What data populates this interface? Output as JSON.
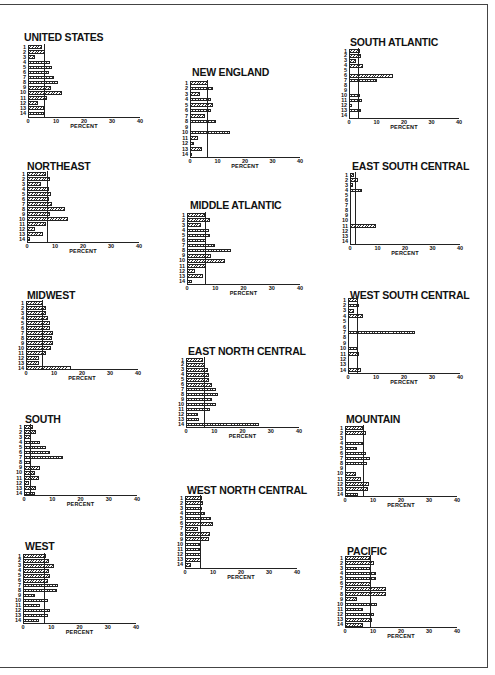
{
  "chart_data": [
    {
      "type": "bar",
      "orientation": "horizontal",
      "title": "UNITED STATES",
      "xlabel": "PERCENT",
      "xlim": [
        0,
        40
      ],
      "xticks": [
        0,
        10,
        20,
        30,
        40
      ],
      "categories": [
        "1",
        "2",
        "3",
        "4",
        "5",
        "6",
        "7",
        "8",
        "9",
        "10",
        "11",
        "12",
        "13",
        "14"
      ],
      "values": [
        5,
        6,
        2.4,
        8,
        8.6,
        7.5,
        9.3,
        10.7,
        8.2,
        12,
        6.7,
        3.6,
        5.7,
        5.7
      ],
      "reference_line": 5.7
    },
    {
      "type": "bar",
      "orientation": "horizontal",
      "title": "NEW ENGLAND",
      "xlabel": "PERCENT",
      "xlim": [
        0,
        40
      ],
      "xticks": [
        0,
        10,
        20,
        30,
        40
      ],
      "categories": [
        "1",
        "2",
        "3",
        "4",
        "5",
        "6",
        "7",
        "8",
        "9",
        "10",
        "11",
        "12",
        "13",
        "14"
      ],
      "values": [
        6.5,
        8.2,
        3.7,
        7.7,
        8.5,
        7.7,
        5.5,
        9.4,
        0,
        14.4,
        2.8,
        1.6,
        4.3,
        0.9
      ],
      "reference_line": 6.3
    },
    {
      "type": "bar",
      "orientation": "horizontal",
      "title": "SOUTH ATLANTIC",
      "xlabel": "PERCENT",
      "xlim": [
        0,
        40
      ],
      "xticks": [
        0,
        10,
        20,
        30,
        40
      ],
      "categories": [
        "1",
        "2",
        "3",
        "4",
        "5",
        "6",
        "7",
        "8",
        "9",
        "10",
        "11",
        "12",
        "13",
        "14"
      ],
      "values": [
        3.9,
        4.3,
        2.4,
        5.2,
        0,
        16,
        10,
        0,
        0,
        4,
        4.7,
        1.1,
        4.2,
        0
      ],
      "reference_line": 3.4
    },
    {
      "type": "bar",
      "orientation": "horizontal",
      "title": "NORTHEAST",
      "xlabel": "PERCENT",
      "xlim": [
        0,
        40
      ],
      "xticks": [
        0,
        10,
        20,
        30,
        40
      ],
      "categories": [
        "1",
        "2",
        "3",
        "4",
        "5",
        "6",
        "7",
        "8",
        "9",
        "10",
        "11",
        "12",
        "13",
        "14"
      ],
      "values": [
        6.7,
        8.2,
        4.9,
        7.9,
        8.5,
        7.9,
        8.9,
        13.4,
        8.2,
        14.6,
        6.7,
        3,
        5.7,
        1.2
      ],
      "reference_line": 7
    },
    {
      "type": "bar",
      "orientation": "horizontal",
      "title": "MIDDLE ATLANTIC",
      "xlabel": "PERCENT",
      "xlim": [
        0,
        40
      ],
      "xticks": [
        0,
        10,
        20,
        30,
        40
      ],
      "categories": [
        "1",
        "2",
        "3",
        "4",
        "5",
        "6",
        "7",
        "8",
        "9",
        "10",
        "11",
        "12",
        "13",
        "14"
      ],
      "values": [
        6.4,
        8.1,
        5.1,
        7.7,
        8.1,
        6.9,
        10,
        15.7,
        8.5,
        13.4,
        6.6,
        3,
        5.5,
        1.8
      ],
      "reference_line": 6.4
    },
    {
      "type": "bar",
      "orientation": "horizontal",
      "title": "EAST SOUTH CENTRAL",
      "xlabel": "PERCENT",
      "xlim": [
        0,
        40
      ],
      "xticks": [
        0,
        10,
        20,
        30,
        40
      ],
      "categories": [
        "1",
        "2",
        "3",
        "4",
        "5",
        "6",
        "7",
        "8",
        "9",
        "10",
        "11",
        "12",
        "13",
        "14"
      ],
      "values": [
        1.6,
        2.8,
        1.2,
        4.3,
        0,
        0,
        0,
        0,
        0,
        0,
        9.5,
        0,
        0,
        0
      ],
      "reference_line": 1.8
    },
    {
      "type": "bar",
      "orientation": "horizontal",
      "title": "MIDWEST",
      "xlabel": "PERCENT",
      "xlim": [
        0,
        40
      ],
      "xticks": [
        0,
        10,
        20,
        30,
        40
      ],
      "categories": [
        "1",
        "2",
        "3",
        "4",
        "5",
        "6",
        "7",
        "8",
        "9",
        "10",
        "11",
        "12",
        "13",
        "14"
      ],
      "values": [
        6,
        7.2,
        7,
        7.9,
        8.5,
        8.5,
        9.6,
        9.4,
        9.6,
        9.1,
        7.2,
        4.5,
        4.8,
        16.1
      ],
      "reference_line": 5.7
    },
    {
      "type": "bar",
      "orientation": "horizontal",
      "title": "EAST NORTH CENTRAL",
      "xlabel": "PERCENT",
      "xlim": [
        0,
        40
      ],
      "xticks": [
        0,
        10,
        20,
        30,
        40
      ],
      "categories": [
        "1",
        "2",
        "3",
        "4",
        "5",
        "6",
        "7",
        "8",
        "9",
        "10",
        "11",
        "12",
        "13",
        "14"
      ],
      "values": [
        5.9,
        6.7,
        7.9,
        8.2,
        8.2,
        9.3,
        10.5,
        11.4,
        9.1,
        10.5,
        8.5,
        4.4,
        4.7,
        25.9
      ],
      "reference_line": 6.4
    },
    {
      "type": "bar",
      "orientation": "horizontal",
      "title": "WEST SOUTH CENTRAL",
      "xlabel": "PERCENT",
      "xlim": [
        0,
        40
      ],
      "xticks": [
        0,
        10,
        20,
        30,
        40
      ],
      "categories": [
        "1",
        "2",
        "3",
        "4",
        "5",
        "6",
        "7",
        "8",
        "9",
        "10",
        "11",
        "12",
        "13",
        "14"
      ],
      "values": [
        3.4,
        4,
        2.3,
        5.4,
        0,
        0,
        24.1,
        0,
        0,
        3.5,
        3.8,
        0,
        0,
        4.6
      ],
      "reference_line": 3.1
    },
    {
      "type": "bar",
      "orientation": "horizontal",
      "title": "SOUTH",
      "xlabel": "PERCENT",
      "xlim": [
        0,
        40
      ],
      "xticks": [
        0,
        10,
        20,
        30,
        40
      ],
      "categories": [
        "1",
        "2",
        "3",
        "4",
        "5",
        "6",
        "7",
        "8",
        "9",
        "10",
        "11",
        "12",
        "13",
        "14"
      ],
      "values": [
        3.3,
        4.4,
        2.4,
        5.6,
        7.9,
        9.1,
        13.7,
        2.4,
        5.8,
        3.8,
        5.3,
        1.7,
        4.4,
        3.8
      ],
      "reference_line": 2
    },
    {
      "type": "bar",
      "orientation": "horizontal",
      "title": "WEST NORTH CENTRAL",
      "xlabel": "PERCENT",
      "xlim": [
        0,
        40
      ],
      "xticks": [
        0,
        10,
        20,
        30,
        40
      ],
      "categories": [
        "1",
        "2",
        "3",
        "4",
        "5",
        "6",
        "7",
        "8",
        "9",
        "10",
        "11",
        "12",
        "13",
        "14"
      ],
      "values": [
        6,
        6.6,
        6,
        7,
        9.4,
        9.9,
        4.8,
        8.8,
        8.4,
        5.4,
        5.4,
        5.7,
        5.7,
        2
      ],
      "reference_line": 5.4
    },
    {
      "type": "bar",
      "orientation": "horizontal",
      "title": "MOUNTAIN",
      "xlabel": "PERCENT",
      "xlim": [
        0,
        40
      ],
      "xticks": [
        0,
        10,
        20,
        30,
        40
      ],
      "categories": [
        "1",
        "2",
        "3",
        "4",
        "5",
        "6",
        "7",
        "8",
        "9",
        "10",
        "11",
        "12",
        "13",
        "14"
      ],
      "values": [
        6.3,
        7.5,
        0,
        6.4,
        4.2,
        7.5,
        8.8,
        7.8,
        0,
        4,
        5.7,
        8.4,
        8.2,
        4.8
      ],
      "reference_line": 6.3
    },
    {
      "type": "bar",
      "orientation": "horizontal",
      "title": "WEST",
      "xlabel": "PERCENT",
      "xlim": [
        0,
        40
      ],
      "xticks": [
        0,
        10,
        20,
        30,
        40
      ],
      "categories": [
        "1",
        "2",
        "3",
        "4",
        "5",
        "6",
        "7",
        "8",
        "9",
        "10",
        "11",
        "12",
        "13",
        "14"
      ],
      "values": [
        8.2,
        9.2,
        10.9,
        9.2,
        9.6,
        8.8,
        12.4,
        12.1,
        4.4,
        8.8,
        5.9,
        9.4,
        8.8,
        5.6
      ],
      "reference_line": 7.6
    },
    {
      "type": "bar",
      "orientation": "horizontal",
      "title": "PACIFIC",
      "xlabel": "PERCENT",
      "xlim": [
        0,
        40
      ],
      "xticks": [
        0,
        10,
        20,
        30,
        40
      ],
      "categories": [
        "1",
        "2",
        "3",
        "4",
        "5",
        "6",
        "7",
        "8",
        "9",
        "10",
        "11",
        "12",
        "13",
        "14"
      ],
      "values": [
        8.8,
        10.2,
        8.8,
        11.1,
        11.2,
        9.3,
        14.7,
        14.5,
        4.2,
        11.4,
        6.3,
        10.2,
        9.6,
        6.3
      ],
      "reference_line": 8.8
    }
  ],
  "layout": [
    {
      "title_x": 24,
      "title_y": 31,
      "x0": 28,
      "x40": 140,
      "row0": 47,
      "row_step": 5.1,
      "axis_y": 117
    },
    {
      "title_x": 192,
      "title_y": 66,
      "x0": 190,
      "x40": 300,
      "row0": 83,
      "row_step": 5.5,
      "axis_y": 157
    },
    {
      "title_x": 350,
      "title_y": 36,
      "x0": 349,
      "x40": 459,
      "row0": 51,
      "row_step": 4.95,
      "axis_y": 118
    },
    {
      "title_x": 27,
      "title_y": 160,
      "x0": 27,
      "x40": 139,
      "row0": 174,
      "row_step": 5.0,
      "axis_y": 242
    },
    {
      "title_x": 190,
      "title_y": 199,
      "x0": 187,
      "x40": 300,
      "row0": 215,
      "row_step": 5.1,
      "axis_y": 284
    },
    {
      "title_x": 352,
      "title_y": 160,
      "x0": 350,
      "x40": 460,
      "row0": 175,
      "row_step": 5.1,
      "axis_y": 244
    },
    {
      "title_x": 27,
      "title_y": 289,
      "x0": 26,
      "x40": 138,
      "row0": 303,
      "row_step": 5.0,
      "axis_y": 369
    },
    {
      "title_x": 188,
      "title_y": 345,
      "x0": 186,
      "x40": 299,
      "row0": 360,
      "row_step": 4.95,
      "axis_y": 427
    },
    {
      "title_x": 350,
      "title_y": 289,
      "x0": 348,
      "x40": 460,
      "row0": 300,
      "row_step": 5.4,
      "axis_y": 373
    },
    {
      "title_x": 25,
      "title_y": 413,
      "x0": 24,
      "x40": 137,
      "row0": 427,
      "row_step": 5.1,
      "axis_y": 495
    },
    {
      "title_x": 187,
      "title_y": 484,
      "x0": 185,
      "x40": 297,
      "row0": 498,
      "row_step": 5.15,
      "axis_y": 568
    },
    {
      "title_x": 346,
      "title_y": 413,
      "x0": 345,
      "x40": 457,
      "row0": 428,
      "row_step": 5.1,
      "axis_y": 496
    },
    {
      "title_x": 25,
      "title_y": 540,
      "x0": 23,
      "x40": 136,
      "row0": 556,
      "row_step": 4.95,
      "axis_y": 623
    },
    {
      "title_x": 347,
      "title_y": 545,
      "x0": 345,
      "x40": 457,
      "row0": 558,
      "row_step": 5.15,
      "axis_y": 627
    }
  ]
}
